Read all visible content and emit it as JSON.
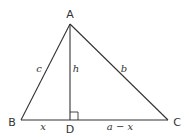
{
  "diagram": {
    "type": "triangle-with-altitude",
    "colors": {
      "stroke": "#333333",
      "text": "#333333",
      "background": "#ffffff"
    },
    "vertices": {
      "A": {
        "label": "A",
        "x": 70,
        "y": 24
      },
      "B": {
        "label": "B",
        "x": 21,
        "y": 120
      },
      "C": {
        "label": "C",
        "x": 168,
        "y": 120
      },
      "D": {
        "label": "D",
        "x": 70,
        "y": 120
      }
    },
    "segment_labels": {
      "c": "c",
      "h": "h",
      "b": "b",
      "x": "x",
      "a_minus_x": "a − x"
    },
    "right_angle_marker": {
      "at": "D",
      "size": 8
    }
  }
}
